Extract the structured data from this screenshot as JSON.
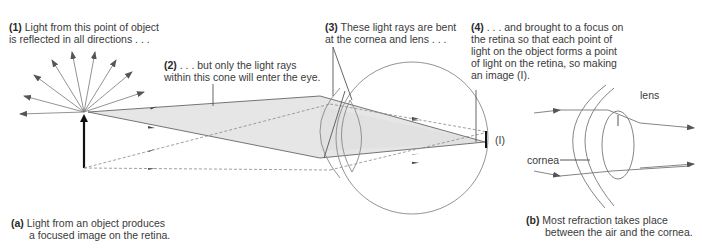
{
  "diagram": {
    "panel_a": {
      "caption_tag": "(a)",
      "caption_line1": "Light from an object produces",
      "caption_line2": "a focused image on the retina.",
      "annotations": [
        {
          "tag": "(1)",
          "line1": "Light from this point of object",
          "line2": "is reflected in all directions . . ."
        },
        {
          "tag": "(2)",
          "line1": ". . . but only the light rays",
          "line2": "within this cone will enter the eye."
        },
        {
          "tag": "(3)",
          "line1": "These light rays are bent",
          "line2": "at the cornea and lens . . ."
        },
        {
          "tag": "(4)",
          "line1": ". . . and brought to a focus on",
          "line2": "the retina so that each point of",
          "line3": "light on the object forms a point",
          "line4": "of light on the retina, so making",
          "line5": "an image (I)."
        }
      ],
      "image_label": "(I)"
    },
    "panel_b": {
      "caption_tag": "(b)",
      "caption_line1": "Most refraction takes place",
      "caption_line2": "between the air and the cornea.",
      "labels": {
        "lens": "lens",
        "cornea": "cornea"
      }
    },
    "colors": {
      "line": "#6a6a6a",
      "cone_fill": "#e6e6e6",
      "object_arrow": "#111111",
      "text": "#3a3a3a"
    }
  }
}
